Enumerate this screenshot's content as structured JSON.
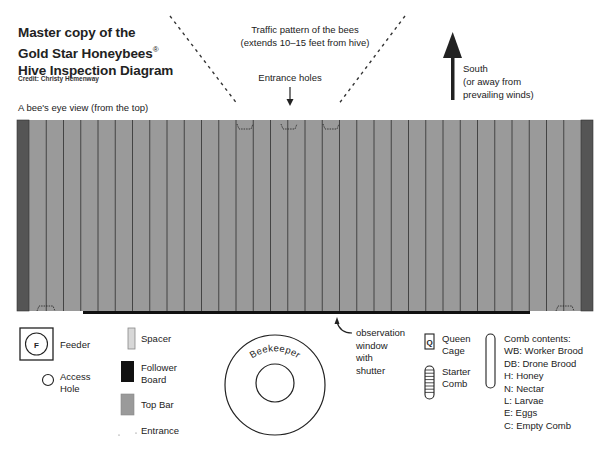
{
  "header": {
    "title_lines": [
      "Master copy of the",
      "Gold Star Honeybees",
      "Hive Inspection Diagram"
    ],
    "registered_mark": "®",
    "credit": "Credit: Christy Hemenway",
    "view_label": "A bee's eye view (from the top)"
  },
  "annotations": {
    "traffic_line1": "Traffic pattern of the bees",
    "traffic_line2": "(extends 10–15 feet from hive)",
    "entrance_holes": "Entrance holes",
    "south_line1": "South",
    "south_line2": "(or away from",
    "south_line3": "prevailing winds)",
    "observation_line1": "observation",
    "observation_line2": "window",
    "observation_line3": "with",
    "observation_line4": "shutter",
    "beekeeper": "Beekeeper"
  },
  "hive": {
    "top_bar_count": 32,
    "entrance_holes_top": 3,
    "entrance_holes_bottom": 2,
    "colors": {
      "top_bar": "#9a9a9a",
      "bar_divider": "#3a3a3a",
      "follower_board": "#555555",
      "observation_window": "#111111"
    }
  },
  "legend": {
    "feeder_symbol": "F",
    "feeder": "Feeder",
    "access_hole_line1": "Access",
    "access_hole_line2": "Hole",
    "spacer": "Spacer",
    "follower_board_line1": "Follower",
    "follower_board_line2": "Board",
    "top_bar": "Top Bar",
    "entrance": "Entrance",
    "queen_symbol": "Q",
    "queen_cage_line1": "Queen",
    "queen_cage_line2": "Cage",
    "starter_comb_line1": "Starter",
    "starter_comb_line2": "Comb",
    "comb_contents_title": "Comb contents:",
    "comb_contents": [
      "WB: Worker Brood",
      "DB: Drone Brood",
      "H: Honey",
      "N: Nectar",
      "L: Larvae",
      "E: Eggs",
      "C: Empty Comb"
    ]
  }
}
